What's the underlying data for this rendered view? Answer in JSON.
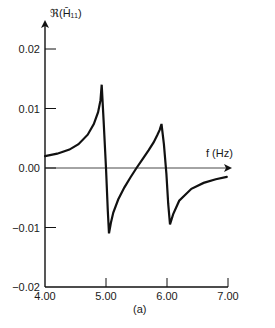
{
  "chart_data": {
    "type": "line",
    "title": "",
    "caption": "(a)",
    "xlabel": "f (Hz)",
    "ylabel": "ℜ(H̄₁₁)",
    "xlim": [
      4.0,
      7.0
    ],
    "ylim": [
      -0.02,
      0.02
    ],
    "x_ticks": [
      4.0,
      5.0,
      6.0,
      7.0
    ],
    "x_tick_labels": [
      "4.00",
      "5.00",
      "6.00",
      "7.00"
    ],
    "y_ticks": [
      -0.02,
      -0.01,
      0.0,
      0.01,
      0.02
    ],
    "y_tick_labels": [
      "−0.02",
      "−0.01",
      "0.00",
      "0.01",
      "0.02"
    ],
    "grid": false,
    "legend": null,
    "zero_line": true,
    "series": [
      {
        "name": "Real part of H11",
        "color": "#111111",
        "x": [
          4.0,
          4.2,
          4.4,
          4.55,
          4.7,
          4.8,
          4.87,
          4.91,
          4.93,
          4.96,
          5.0,
          5.03,
          5.05,
          5.08,
          5.12,
          5.2,
          5.3,
          5.4,
          5.5,
          5.6,
          5.7,
          5.78,
          5.84,
          5.88,
          5.91,
          5.95,
          5.99,
          6.02,
          6.05,
          6.1,
          6.2,
          6.4,
          6.6,
          6.8,
          6.98
        ],
        "y": [
          0.002,
          0.0024,
          0.0031,
          0.004,
          0.0056,
          0.0074,
          0.0094,
          0.0114,
          0.014,
          0.008,
          0.0,
          -0.0072,
          -0.011,
          -0.0092,
          -0.0075,
          -0.0053,
          -0.0033,
          -0.0016,
          0.0,
          0.0015,
          0.003,
          0.0043,
          0.0055,
          0.0064,
          0.0074,
          0.004,
          -0.001,
          -0.006,
          -0.0095,
          -0.0078,
          -0.0055,
          -0.0035,
          -0.0025,
          -0.0019,
          -0.0015
        ]
      }
    ],
    "annotations": [
      {
        "text": "peak",
        "x": 4.93,
        "y": 0.014
      },
      {
        "text": "trough",
        "x": 5.05,
        "y": -0.011
      },
      {
        "text": "peak",
        "x": 5.91,
        "y": 0.0074
      },
      {
        "text": "trough",
        "x": 6.05,
        "y": -0.0095
      }
    ]
  }
}
